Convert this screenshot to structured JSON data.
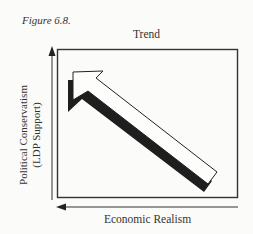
{
  "figure": {
    "label": "Figure 6.8.",
    "title": "Trend",
    "y_axis": {
      "line1": "Political Conservatism",
      "line2": "(LDP Support)",
      "direction": "up"
    },
    "x_axis": {
      "label": "Economic Realism",
      "direction": "left"
    },
    "arrow": {
      "description": "Large hollow block arrow with drop shadow pointing from lower-right to upper-left",
      "from": "lower-right",
      "to": "upper-left"
    },
    "colors": {
      "ink": "#222222",
      "background": "#fbfbf9"
    }
  }
}
